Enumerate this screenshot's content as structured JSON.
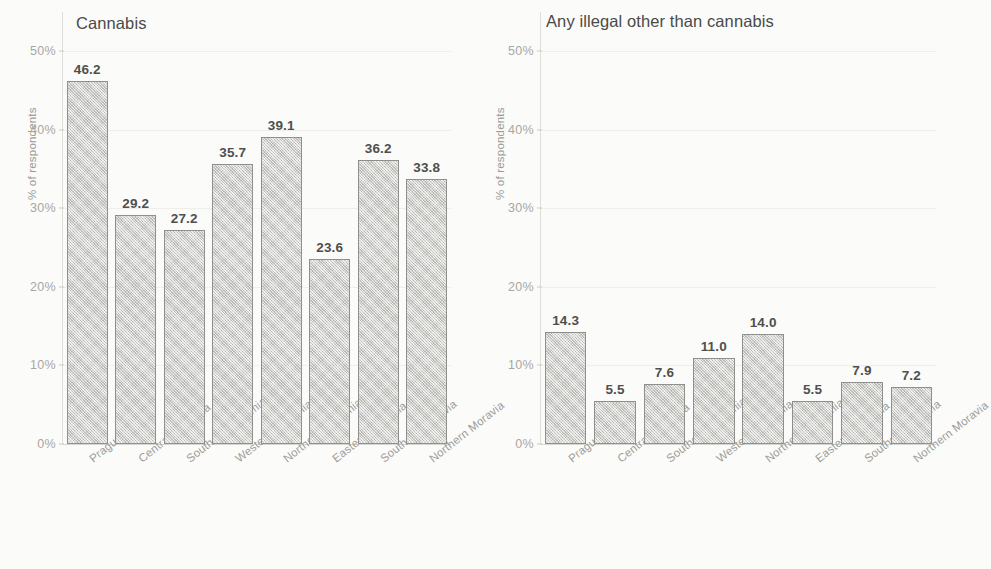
{
  "figure": {
    "background_color": "#fbfbfa",
    "panels": [
      {
        "key": "cannabis",
        "title": "Cannabis",
        "ylabel": "% of respondents"
      },
      {
        "key": "anyillegal",
        "title": "Any illegal other than cannabis",
        "ylabel": "% of respondents"
      }
    ]
  },
  "axis": {
    "ticks": [
      {
        "label": "50%",
        "value": 50
      },
      {
        "label": "40%",
        "value": 40
      },
      {
        "label": "30%",
        "value": 30
      },
      {
        "label": "20%",
        "value": 20
      },
      {
        "label": "10%",
        "value": 10
      },
      {
        "label": "0%",
        "value": 0
      }
    ]
  },
  "chart_data": [
    {
      "type": "bar",
      "title": "Cannabis",
      "xlabel": "",
      "ylabel": "% of respondents",
      "ylim": [
        0,
        50
      ],
      "yticks": [
        0,
        10,
        20,
        30,
        40,
        50
      ],
      "ytick_labels": [
        "0%",
        "10%",
        "20%",
        "30%",
        "40%",
        "50%"
      ],
      "grid": true,
      "legend": "none",
      "categories": [
        "Prague",
        "Central Bohemia",
        "Southern Bohemia",
        "Western Bohemia",
        "Northern Bohemia",
        "Eastern Bohemia",
        "Southern Moravia",
        "Northern Moravia"
      ],
      "values": [
        46.2,
        29.2,
        27.2,
        35.7,
        39.1,
        23.6,
        36.2,
        33.8
      ],
      "value_labels": [
        "46.2",
        "29.2",
        "27.2",
        "35.7",
        "39.1",
        "23.6",
        "36.2",
        "33.8"
      ],
      "bar_fill_color": "#cfcfcb",
      "bar_edge_color": "#8f8f8b"
    },
    {
      "type": "bar",
      "title": "Any illegal other than cannabis",
      "xlabel": "",
      "ylabel": "% of respondents",
      "ylim": [
        0,
        50
      ],
      "yticks": [
        0,
        10,
        20,
        30,
        40,
        50
      ],
      "ytick_labels": [
        "0%",
        "10%",
        "20%",
        "30%",
        "40%",
        "50%"
      ],
      "grid": true,
      "legend": "none",
      "categories": [
        "Prague",
        "Central Bohemia",
        "Southern Bohemia",
        "Western Bohemia",
        "Northern Bohemia",
        "Eastern Bohemia",
        "Southern Moravia",
        "Northern Moravia"
      ],
      "values": [
        14.3,
        5.5,
        7.6,
        11.0,
        14.0,
        5.5,
        7.9,
        7.2
      ],
      "value_labels": [
        "14.3",
        "5.5",
        "7.6",
        "11.0",
        "14.0",
        "5.5",
        "7.9",
        "7.2"
      ],
      "bar_fill_color": "#cfcfcb",
      "bar_edge_color": "#8f8f8b"
    }
  ]
}
